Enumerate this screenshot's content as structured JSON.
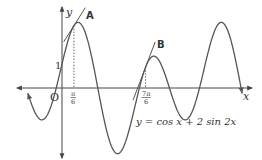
{
  "figure": {
    "function_label": "y = cos x + 2 sin 2x",
    "axis_labels": {
      "x": "x",
      "y": "y",
      "origin": "O"
    },
    "tick_labels": {
      "y_one": "1",
      "x_pi_6_num": "π",
      "x_pi_6_den": "6",
      "x_7pi_6_num": "7π",
      "x_7pi_6_den": "6"
    },
    "tangent_labels": {
      "a": "A",
      "b": "B"
    },
    "colors": {
      "curve": "#555555",
      "axis": "#444444",
      "text": "#333333",
      "guide": "#666666"
    }
  },
  "chart_data": {
    "type": "line",
    "title": "",
    "function": "cos(x) + 2*sin(2x)",
    "xlabel": "x",
    "ylabel": "y",
    "xlim": [
      -1.5,
      8.1
    ],
    "ylim": [
      -3,
      3
    ],
    "series": [
      {
        "name": "y = cos x + 2 sin 2x",
        "x_range": [
          -1.5,
          7.9
        ]
      },
      {
        "name": "Tangent A",
        "touches_at_x": "π/6"
      },
      {
        "name": "Tangent B",
        "touches_at_x": "7π/6"
      }
    ],
    "annotations": [
      {
        "text": "1",
        "at": [
          0,
          1
        ]
      },
      {
        "text": "π/6",
        "at_x": 0.5236
      },
      {
        "text": "7π/6",
        "at_x": 3.6652
      },
      {
        "text": "O",
        "at": [
          0,
          0
        ]
      },
      {
        "text": "A",
        "label_for": "tangent at π/6"
      },
      {
        "text": "B",
        "label_for": "tangent at 7π/6"
      }
    ],
    "grid": false
  }
}
